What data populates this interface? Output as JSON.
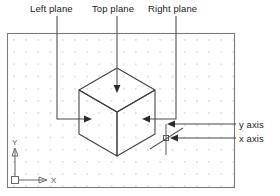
{
  "figure": {
    "type": "cad-isometric-drawing",
    "background_color": "#ffffff",
    "line_color": "#3a3a3a",
    "grid_dot_color": "#d6d2e0",
    "border_color": "#6e6e6e"
  },
  "annotations": {
    "left_plane_label": "Left plane",
    "top_plane_label": "Top plane",
    "right_plane_label": "Right plane",
    "y_axis_label": "y axis",
    "x_axis_label": "x axis"
  },
  "ucs_icon": {
    "y_label": "Y",
    "x_label": "X"
  },
  "drawing_area": {
    "border": {
      "x": 7,
      "y": 33,
      "width": 228,
      "height": 155
    },
    "grid": {
      "spacing": 12.2,
      "origin_x": 13,
      "origin_y": 39
    }
  },
  "cube": {
    "top_vertex": {
      "x": 117,
      "y": 68
    },
    "left_vertex": {
      "x": 79,
      "y": 90
    },
    "right_vertex": {
      "x": 155,
      "y": 90
    },
    "center_vertex": {
      "x": 117,
      "y": 112
    },
    "bottom_left": {
      "x": 79,
      "y": 134
    },
    "bottom_right": {
      "x": 155,
      "y": 134
    },
    "bottom_vertex": {
      "x": 117,
      "y": 156
    }
  },
  "leaders": {
    "left_plane": {
      "from_x": 57,
      "from_y": 16,
      "down_to_y": 119,
      "arrow_to_x": 92
    },
    "top_plane": {
      "from_x": 117,
      "from_y": 16,
      "arrow_to_y": 92
    },
    "right_plane": {
      "from_x": 176,
      "from_y": 16,
      "down_to_y": 119,
      "arrow_to_x": 142
    },
    "y_axis": {
      "from_x": 236,
      "from_y": 124,
      "arrow_to_x": 168
    },
    "x_axis": {
      "from_x": 236,
      "from_y": 138,
      "arrow_to_x": 170
    }
  },
  "crosshair_cursor": {
    "center": {
      "x": 166,
      "y": 138
    },
    "vertical_top_y": 124,
    "vertical_bottom_y": 154,
    "diagonal_start": {
      "x": 150,
      "y": 150
    },
    "diagonal_end": {
      "x": 182,
      "y": 128
    },
    "pick_box_size": 5
  }
}
